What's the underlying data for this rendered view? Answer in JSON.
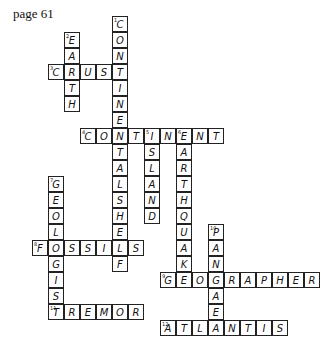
{
  "page_label": "page 61",
  "grid": {
    "cell_size": 16,
    "origin_x": 80,
    "origin_y": 16
  },
  "words": [
    {
      "number": "1",
      "answer": "CONTINENTALSHELF",
      "direction": "down",
      "col": 2,
      "row": 0
    },
    {
      "number": "2",
      "answer": "EARTH",
      "direction": "down",
      "col": -1,
      "row": 1
    },
    {
      "number": "3",
      "answer": "CRUST",
      "direction": "across",
      "col": -2,
      "row": 3
    },
    {
      "number": "4",
      "answer": "CONTINENT",
      "direction": "across",
      "col": 0,
      "row": 7
    },
    {
      "number": "5",
      "answer": "ISLAND",
      "direction": "down",
      "col": 4,
      "row": 7
    },
    {
      "number": "6",
      "answer": "EARTHQUAKE",
      "direction": "down",
      "col": 6,
      "row": 7
    },
    {
      "number": "7",
      "answer": "GEOLOGIST",
      "direction": "down",
      "col": -2,
      "row": 10
    },
    {
      "number": "8",
      "answer": "FOSSILS",
      "direction": "across",
      "col": -3,
      "row": 14
    },
    {
      "number": "10",
      "answer": "PANGAEA",
      "direction": "down",
      "col": 8,
      "row": 13
    },
    {
      "number": "9",
      "answer": "GEOGRAPHER",
      "direction": "across",
      "col": 5,
      "row": 16
    },
    {
      "number": "11",
      "answer": "TREMOR",
      "direction": "across",
      "col": -2,
      "row": 18
    },
    {
      "number": "12",
      "answer": "ATLANTIS",
      "direction": "across",
      "col": 5,
      "row": 19
    }
  ]
}
